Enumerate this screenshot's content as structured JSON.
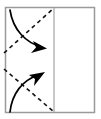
{
  "diagram": {
    "type": "origami-fold-instruction",
    "colors": {
      "paper_border": "#9a9a9a",
      "fold_line": "#a5a5a5",
      "crease_dashed": "#111111",
      "motion_arrow": "#000000",
      "paper_fill": "#ffffff",
      "background": "#ffffff"
    },
    "paper": {
      "label": "paper-sheet",
      "x": 5.5,
      "y": 7.5,
      "width": 89,
      "height": 105,
      "stroke_width": 1.5
    },
    "fold_line": {
      "label": "vertical-fold-line",
      "x": 54,
      "y_top": 7.5,
      "y_bottom": 112.5,
      "stroke_width": 1.2
    },
    "creases": [
      {
        "label": "upper-crease-dashed",
        "x1": 4,
        "y1": 53,
        "x2": 54,
        "y2": 8,
        "dash": "4 3.5",
        "stroke_width": 1.6
      },
      {
        "label": "lower-crease-dashed",
        "x1": 4,
        "y1": 69,
        "x2": 54,
        "y2": 112,
        "dash": "4 3.5",
        "stroke_width": 1.6
      }
    ],
    "arrows": [
      {
        "label": "upper-fold-arrow",
        "path": "M 10 10 C 13 30 26 43 42 47",
        "head": "M 47 48.5 L 33 41 L 36 47.5 L 31 53 Z",
        "stroke_width": 1.7,
        "direction": "down-right"
      },
      {
        "label": "lower-fold-arrow",
        "path": "M 10 112 C 12 94 22 80 39 75",
        "head": "M 45 72 L 29 75 L 35 79 L 34 86 Z",
        "stroke_width": 1.7,
        "direction": "up-right"
      }
    ]
  }
}
